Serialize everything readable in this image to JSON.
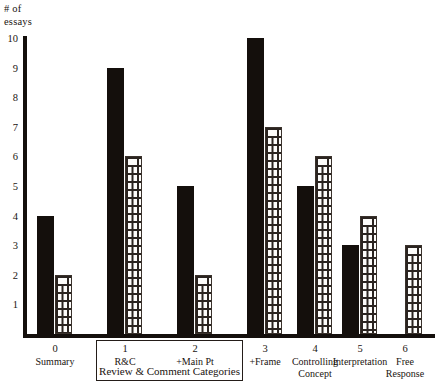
{
  "chart_data": {
    "type": "bar",
    "title": "",
    "xlabel": "Review & Comment Categories",
    "ylabel": "# of essays",
    "ylim": [
      0,
      10
    ],
    "yticks": [
      1,
      2,
      3,
      4,
      5,
      6,
      7,
      8,
      9,
      10
    ],
    "grid": false,
    "legend": "none",
    "categories": [
      "Summary",
      "R&C",
      "+Main Pt",
      "+Frame",
      "Controlling Concept",
      "Interpretation",
      "Free Response"
    ],
    "category_numbers": [
      "0",
      "1",
      "2",
      "3",
      "4",
      "5",
      "6"
    ],
    "series": [
      {
        "name": "solid",
        "pattern": "solid-black",
        "values": [
          4,
          9,
          5,
          10,
          5,
          3,
          0
        ]
      },
      {
        "name": "brick",
        "pattern": "brick-hatch",
        "values": [
          2,
          6,
          2,
          7,
          6,
          4,
          3
        ]
      }
    ],
    "annotations": [
      {
        "text": "Review & Comment Categories",
        "covers": [
          "1",
          "2",
          "3"
        ],
        "style": "boxed"
      }
    ],
    "colors": {
      "solid": "#140f0c",
      "brick_line": "#2b2420",
      "brick_fill": "#fdfcfa",
      "axis": "#140f0c"
    }
  },
  "axis": {
    "y_title_line1": "# of",
    "y_title_line2": "essays"
  },
  "group_box": {
    "label": "Review & Comment  Categories"
  }
}
